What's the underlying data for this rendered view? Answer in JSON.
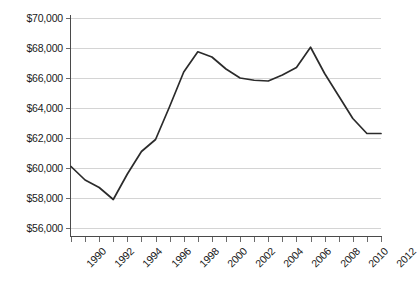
{
  "chart_data": {
    "type": "line",
    "title": "",
    "xlabel": "",
    "ylabel": "",
    "xlim": [
      1990,
      2012
    ],
    "ylim": [
      56000,
      70000
    ],
    "ytick_step": 2000,
    "grid": true,
    "legend": "none",
    "value_prefix": "$",
    "line_color": "#2b2b2b",
    "grid_color": "#d4d4d4",
    "axis_color": "#4a4a4a",
    "ytick_labels": [
      "$70,000",
      "$68,000",
      "$66,000",
      "$64,000",
      "$62,000",
      "$60,000",
      "$58,000",
      "$56,000"
    ],
    "ytick_values": [
      70000,
      68000,
      66000,
      64000,
      62000,
      60000,
      58000,
      56000
    ],
    "xtick_labels": [
      "1990",
      "1992",
      "1994",
      "1996",
      "1998",
      "2000",
      "2002",
      "2004",
      "2006",
      "2008",
      "2010",
      "2012"
    ],
    "xtick_values": [
      1990,
      1992,
      1994,
      1996,
      1998,
      2000,
      2002,
      2004,
      2006,
      2008,
      2010,
      2012
    ],
    "x": [
      1990,
      1991,
      1992,
      1993,
      1994,
      1995,
      1996,
      1997,
      1998,
      1999,
      2000,
      2001,
      2002,
      2003,
      2004,
      2005,
      2006,
      2007,
      2008,
      2009,
      2010,
      2011,
      2012
    ],
    "values": [
      60100,
      59200,
      58700,
      57900,
      59600,
      61100,
      61900,
      64100,
      66400,
      67750,
      67400,
      66600,
      66000,
      65850,
      65800,
      66200,
      66700,
      68050,
      66300,
      64800,
      63300,
      62300,
      62300
    ]
  }
}
